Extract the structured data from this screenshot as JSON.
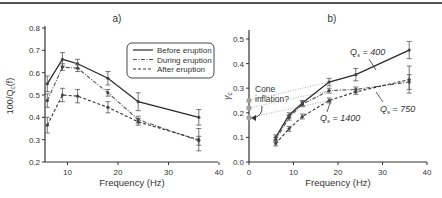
{
  "figure": {
    "panel_labels": [
      "a)",
      "b)"
    ]
  },
  "chart_data": [
    {
      "type": "line",
      "panel": "a)",
      "title": "a)",
      "xlabel": "Frequency (Hz)",
      "ylabel": "100/Q_c(f)",
      "xlim": [
        5,
        40
      ],
      "ylim": [
        0.2,
        0.8
      ],
      "xticks": [
        10,
        20,
        30,
        40
      ],
      "yticks": [
        0.2,
        0.3,
        0.4,
        0.5,
        0.6,
        0.7,
        0.8
      ],
      "grid": false,
      "legend_position": "upper right (boxed)",
      "x": [
        6,
        9,
        12,
        18,
        24,
        36
      ],
      "series": [
        {
          "name": "Before eruption",
          "style": "solid",
          "values": [
            0.55,
            0.66,
            0.64,
            0.575,
            0.47,
            0.4
          ],
          "err": [
            0.035,
            0.03,
            0.02,
            0.03,
            0.04,
            0.035
          ]
        },
        {
          "name": "During eruption",
          "style": "dash-dot",
          "values": [
            0.475,
            0.625,
            0.62,
            0.51,
            0.39,
            0.295
          ],
          "err": [
            0.03,
            0.015,
            0.015,
            0.015,
            0.015,
            0.02
          ]
        },
        {
          "name": "After eruption",
          "style": "dashed",
          "values": [
            0.365,
            0.5,
            0.495,
            0.445,
            0.38,
            0.3
          ],
          "err": [
            0.035,
            0.03,
            0.03,
            0.025,
            0.015,
            0.05
          ]
        }
      ]
    },
    {
      "type": "line",
      "panel": "b)",
      "title": "b)",
      "xlabel": "Frequency (Hz)",
      "ylabel": "γ_c",
      "xlim": [
        0,
        40
      ],
      "ylim": [
        0.0,
        0.5
      ],
      "xticks": [
        0,
        10,
        20,
        30,
        40
      ],
      "yticks": [
        0.0,
        0.1,
        0.2,
        0.3,
        0.4,
        0.5
      ],
      "grid": false,
      "x": [
        6,
        9,
        12,
        18,
        24,
        36
      ],
      "series": [
        {
          "name": "Q_s = 400",
          "style": "solid",
          "values": [
            0.1,
            0.19,
            0.24,
            0.325,
            0.355,
            0.455
          ],
          "err": [
            0.01,
            0.01,
            0.01,
            0.015,
            0.025,
            0.035
          ]
        },
        {
          "name": "Q_s = 1400",
          "style": "dash-dot",
          "values": [
            0.09,
            0.18,
            0.235,
            0.29,
            0.295,
            0.325
          ],
          "err": [
            0.01,
            0.01,
            0.01,
            0.01,
            0.01,
            0.03
          ]
        },
        {
          "name": "Q_s = 750",
          "style": "dashed",
          "values": [
            0.075,
            0.135,
            0.185,
            0.25,
            0.285,
            0.335
          ],
          "err": [
            0.01,
            0.01,
            0.01,
            0.01,
            0.01,
            0.055
          ]
        }
      ],
      "extrapolated_intercepts": {
        "x": 0,
        "values": [
          0.25,
          0.22,
          0.18
        ],
        "style": "dotted"
      },
      "annotations": [
        {
          "text": "Q_s = 400",
          "near": [
            26,
            0.4
          ]
        },
        {
          "text": "Q_s = 1400",
          "near": [
            17,
            0.16
          ]
        },
        {
          "text": "Q_s = 750",
          "near": [
            33,
            0.21
          ]
        },
        {
          "text": "Cone inflation?",
          "near": [
            3,
            0.28
          ]
        }
      ]
    }
  ],
  "labels": {
    "a": {
      "title": "a)",
      "xlabel": "Frequency (Hz)",
      "ylabel_main": "100/Q",
      "ylabel_sub": "c",
      "ylabel_tail": "(f)",
      "legend": [
        "Before eruption",
        "During eruption",
        "After eruption"
      ],
      "xticks": [
        "10",
        "20",
        "30",
        "40"
      ],
      "yticks": [
        "0.2",
        "0.3",
        "0.4",
        "0.5",
        "0.6",
        "0.7",
        "0.8"
      ]
    },
    "b": {
      "title": "b)",
      "xlabel": "Frequency (Hz)",
      "ylabel_main": "γ",
      "ylabel_sub": "c",
      "xticks": [
        "0",
        "10",
        "20",
        "30",
        "40"
      ],
      "yticks": [
        "0.0",
        "0.1",
        "0.2",
        "0.3",
        "0.4",
        "0.5"
      ],
      "ann_q400": "Q",
      "ann_q400_tail": " = 400",
      "ann_q1400": "Q",
      "ann_q1400_tail": " = 1400",
      "ann_q750": "Q",
      "ann_q750_tail": " = 750",
      "ann_sub": "s",
      "cone_line1": "Cone",
      "cone_line2": "inflation?"
    }
  },
  "colors": {
    "axis": "#333333",
    "series_dark": "#2a2a2a",
    "series_grey": "#555555",
    "dotted": "#999999",
    "marker_grey": "#9a9a9a"
  }
}
